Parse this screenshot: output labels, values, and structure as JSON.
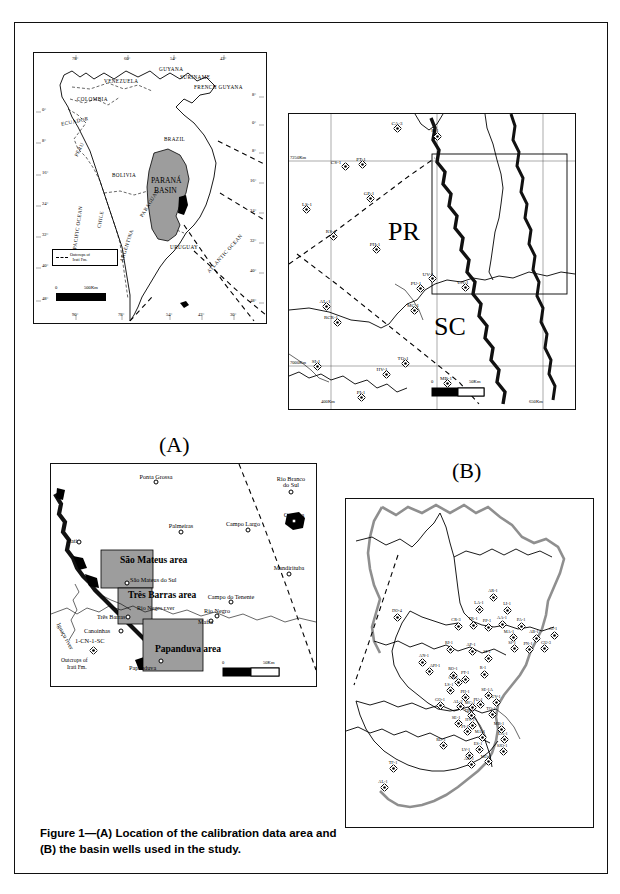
{
  "figure": {
    "caption": "Figure 1—(A) Location of the calibration data area and (B) the basin wells used in the study."
  },
  "panel_sa": {
    "name": "south-america-inset",
    "basin_label_line1": "PARANÁ",
    "basin_label_line2": "BASIN",
    "countries": [
      {
        "label": "VENEZUELA",
        "x": 88,
        "y": 30,
        "rot": 0
      },
      {
        "label": "GUYANA",
        "x": 141,
        "y": 19,
        "rot": 0
      },
      {
        "label": "SURINAME",
        "x": 160,
        "y": 27,
        "rot": 0
      },
      {
        "label": "FRENCH GUYANA",
        "x": 175,
        "y": 35,
        "rot": 0
      },
      {
        "label": "COLOMBIA",
        "x": 62,
        "y": 48,
        "rot": 0
      },
      {
        "label": "ECUADOR",
        "x": 44,
        "y": 70,
        "rot": -12
      },
      {
        "label": "PERU",
        "x": 52,
        "y": 98,
        "rot": -64
      },
      {
        "label": "BRAZIL",
        "x": 148,
        "y": 88,
        "rot": 0
      },
      {
        "label": "BOLIVIA",
        "x": 94,
        "y": 125,
        "rot": 0
      },
      {
        "label": "CHILE",
        "x": 72,
        "y": 168,
        "rot": -80
      },
      {
        "label": "PARAGUAY",
        "x": 122,
        "y": 152,
        "rot": -58
      },
      {
        "label": "ARGENTINA",
        "x": 95,
        "y": 195,
        "rot": -72
      },
      {
        "label": "URUGUAY",
        "x": 153,
        "y": 196,
        "rot": 0
      },
      {
        "label": "PACIFIC OCEAN",
        "x": 41,
        "y": 178,
        "rot": -82
      },
      {
        "label": "ATLANTIC OCEAN",
        "x": 185,
        "y": 202,
        "rot": -48
      }
    ],
    "lat_ticks": [
      "0°",
      "8°",
      "16°",
      "24°",
      "32°",
      "40°",
      "48°"
    ],
    "lat_ticks_right": [
      "8°",
      "0°",
      "8°",
      "16°",
      "24°",
      "32°",
      "40°",
      "48°"
    ],
    "lon_ticks_top": [
      "78°",
      "60°",
      "54°",
      "42°"
    ],
    "lon_ticks_bottom": [
      "90°",
      "78°",
      "54°",
      "42°",
      "30°"
    ],
    "legend_line1": "Outcrops of",
    "legend_line2": "Irati Fm.",
    "scale_zero": "0",
    "scale_max": "500Km"
  },
  "panel_pr_sc": {
    "name": "parana-santa-catarina-map",
    "state_pr": "PR",
    "state_sc": "SC",
    "axis_left_top": "7250Km",
    "axis_left_bottom": "7000Km",
    "axis_bottom_left": "400Km",
    "axis_bottom_right": "650Km",
    "scale_zero": "0",
    "scale_max": "50Km",
    "wells": [
      {
        "id": "CA-3",
        "x": 108,
        "y": 14,
        "lx": 108,
        "ly": 7
      },
      {
        "id": "R-1",
        "x": 148,
        "y": 22,
        "lx": 146,
        "ly": 14
      },
      {
        "id": "CS-1",
        "x": 56,
        "y": 52,
        "lx": 47,
        "ly": 46
      },
      {
        "id": "PT-1",
        "x": 73,
        "y": 50,
        "lx": 72,
        "ly": 43
      },
      {
        "id": "GP-1",
        "x": 81,
        "y": 84,
        "lx": 80,
        "ly": 77
      },
      {
        "id": "LS-1",
        "x": 17,
        "y": 95,
        "lx": 18,
        "ly": 88
      },
      {
        "id": "RS-1",
        "x": 44,
        "y": 122,
        "lx": 42,
        "ly": 115
      },
      {
        "id": "PH-1",
        "x": 87,
        "y": 135,
        "lx": 86,
        "ly": 128
      },
      {
        "id": "UV-1",
        "x": 143,
        "y": 164,
        "lx": 139,
        "ly": 158
      },
      {
        "id": "PU-1",
        "x": 131,
        "y": 174,
        "lx": 127,
        "ly": 167
      },
      {
        "id": "CN-1",
        "x": 176,
        "y": 173,
        "lx": 174,
        "ly": 166
      },
      {
        "id": "AL-1",
        "x": 37,
        "y": 192,
        "lx": 36,
        "ly": 185
      },
      {
        "id": "MC-1",
        "x": 125,
        "y": 196,
        "lx": 124,
        "ly": 189
      },
      {
        "id": "RCR-1",
        "x": 48,
        "y": 208,
        "lx": 42,
        "ly": 201
      },
      {
        "id": "SI-1",
        "x": 28,
        "y": 252,
        "lx": 27,
        "ly": 245
      },
      {
        "id": "TQ-1",
        "x": 116,
        "y": 249,
        "lx": 114,
        "ly": 242
      },
      {
        "id": "HV-1",
        "x": 97,
        "y": 260,
        "lx": 93,
        "ly": 253
      },
      {
        "id": "MB-1",
        "x": 158,
        "y": 269,
        "lx": 157,
        "ly": 262
      },
      {
        "id": "PI-1",
        "x": 72,
        "y": 283,
        "lx": 72,
        "ly": 276
      }
    ]
  },
  "panel_a": {
    "name": "calibration-area-map",
    "label": "(A)",
    "areas": [
      {
        "label": "São Mateus area",
        "x": 86,
        "y": 102
      },
      {
        "label": "Três Barras area",
        "x": 96,
        "y": 137
      },
      {
        "label": "Papanduva area",
        "x": 125,
        "y": 191
      }
    ],
    "river_label": "Rio Negro r.ver",
    "iguacu_label": "Iguaçu river",
    "legend_line1": "Outcrops of",
    "legend_line2": "Irati Fm.",
    "well_label": "1-CN-1-SC",
    "scale_zero": "0",
    "scale_max": "50Km",
    "cities": [
      {
        "name": "Ponta Grossa",
        "x": 105,
        "y": 18,
        "lx": 105,
        "ly": 10,
        "anchor": "center"
      },
      {
        "name": "Rio Branco\ndo Sul",
        "x": 240,
        "y": 28,
        "lx": 240,
        "ly": 12,
        "anchor": "center"
      },
      {
        "name": "Palmeiras",
        "x": 130,
        "y": 68,
        "lx": 130,
        "ly": 59,
        "anchor": "center"
      },
      {
        "name": "Campo Largo",
        "x": 197,
        "y": 66,
        "lx": 192,
        "ly": 57,
        "anchor": "center"
      },
      {
        "name": "Curitiba",
        "x": 243,
        "y": 57,
        "lx": 243,
        "ly": 48,
        "anchor": "center"
      },
      {
        "name": "Irati",
        "x": 28,
        "y": 78,
        "lx": 16,
        "ly": 74,
        "anchor": "left"
      },
      {
        "name": "Mandirituba",
        "x": 238,
        "y": 110,
        "lx": 238,
        "ly": 101,
        "anchor": "center"
      },
      {
        "name": "São Mateus do Sul",
        "x": 76,
        "y": 119,
        "lx": 79,
        "ly": 113,
        "anchor": "left"
      },
      {
        "name": "Campo do Tenente",
        "x": 180,
        "y": 138,
        "lx": 180,
        "ly": 130,
        "anchor": "center"
      },
      {
        "name": "Rio Negro",
        "x": 166,
        "y": 152,
        "lx": 166,
        "ly": 144,
        "anchor": "center"
      },
      {
        "name": "Mafra",
        "x": 160,
        "y": 157,
        "lx": 147,
        "ly": 155,
        "anchor": "left"
      },
      {
        "name": "Três Barras",
        "x": 77,
        "y": 153,
        "lx": 46,
        "ly": 150,
        "anchor": "left"
      },
      {
        "name": "Canoinhas",
        "x": 70,
        "y": 167,
        "lx": 33,
        "ly": 164,
        "anchor": "left"
      },
      {
        "name": "Papanduva",
        "x": 110,
        "y": 197,
        "lx": 78,
        "ly": 201,
        "anchor": "left"
      }
    ]
  },
  "panel_b": {
    "name": "basin-wells-map",
    "label": "(B)",
    "wells": [
      {
        "id": "DO-4",
        "x": 51,
        "y": 118,
        "lx": 51,
        "ly": 110
      },
      {
        "id": "AR-1",
        "x": 147,
        "y": 98,
        "lx": 147,
        "ly": 90
      },
      {
        "id": "LA-1",
        "x": 133,
        "y": 110,
        "lx": 133,
        "ly": 102
      },
      {
        "id": "LI-1",
        "x": 161,
        "y": 111,
        "lx": 161,
        "ly": 103
      },
      {
        "id": "CR-3",
        "x": 112,
        "y": 127,
        "lx": 110,
        "ly": 119
      },
      {
        "id": "TR-1",
        "x": 127,
        "y": 126,
        "lx": 127,
        "ly": 118
      },
      {
        "id": "PP-1",
        "x": 142,
        "y": 128,
        "lx": 141,
        "ly": 120
      },
      {
        "id": "AA-1",
        "x": 156,
        "y": 125,
        "lx": 156,
        "ly": 117
      },
      {
        "id": "PA-1",
        "x": 175,
        "y": 127,
        "lx": 175,
        "ly": 119
      },
      {
        "id": "MA-1",
        "x": 167,
        "y": 138,
        "lx": 163,
        "ly": 131
      },
      {
        "id": "AB-1",
        "x": 190,
        "y": 139,
        "lx": 188,
        "ly": 131
      },
      {
        "id": "AT-1",
        "x": 208,
        "y": 136,
        "lx": 207,
        "ly": 128
      },
      {
        "id": "SJ-1",
        "x": 168,
        "y": 149,
        "lx": 166,
        "ly": 142
      },
      {
        "id": "PN-1",
        "x": 183,
        "y": 150,
        "lx": 182,
        "ly": 143
      },
      {
        "id": "GU-3",
        "x": 198,
        "y": 149,
        "lx": 200,
        "ly": 142
      },
      {
        "id": "RI-1",
        "x": 104,
        "y": 150,
        "lx": 103,
        "ly": 142
      },
      {
        "id": "AP-1",
        "x": 126,
        "y": 152,
        "lx": 125,
        "ly": 144
      },
      {
        "id": "SI-1",
        "x": 142,
        "y": 159,
        "lx": 141,
        "ly": 151
      },
      {
        "id": "AN-1",
        "x": 76,
        "y": 163,
        "lx": 78,
        "ly": 155
      },
      {
        "id": "API-1",
        "x": 83,
        "y": 172,
        "lx": 89,
        "ly": 165
      },
      {
        "id": "RO-1",
        "x": 107,
        "y": 176,
        "lx": 107,
        "ly": 168
      },
      {
        "id": "R-1",
        "x": 138,
        "y": 175,
        "lx": 137,
        "ly": 167
      },
      {
        "id": "PT-1",
        "x": 119,
        "y": 180,
        "lx": 119,
        "ly": 172
      },
      {
        "id": "CS-2",
        "x": 112,
        "y": 183,
        "lx": 107,
        "ly": 177
      },
      {
        "id": "LS-1",
        "x": 104,
        "y": 191,
        "lx": 103,
        "ly": 184
      },
      {
        "id": "PH-1",
        "x": 119,
        "y": 198,
        "lx": 119,
        "ly": 191
      },
      {
        "id": "SE-1A",
        "x": 142,
        "y": 196,
        "lx": 141,
        "ly": 189
      },
      {
        "id": "UV-1",
        "x": 150,
        "y": 203,
        "lx": 150,
        "ly": 196
      },
      {
        "id": "PU-1",
        "x": 134,
        "y": 205,
        "lx": 132,
        "ly": 199
      },
      {
        "id": "MC-1",
        "x": 126,
        "y": 208,
        "lx": 124,
        "ly": 202
      },
      {
        "id": "AL-2",
        "x": 114,
        "y": 207,
        "lx": 112,
        "ly": 201
      },
      {
        "id": "GO-1",
        "x": 94,
        "y": 206,
        "lx": 94,
        "ly": 199
      },
      {
        "id": "TB-1",
        "x": 125,
        "y": 216,
        "lx": 123,
        "ly": 210
      },
      {
        "id": "TQ-1",
        "x": 146,
        "y": 215,
        "lx": 145,
        "ly": 208
      },
      {
        "id": "HV-1",
        "x": 126,
        "y": 226,
        "lx": 124,
        "ly": 219
      },
      {
        "id": "SE-1",
        "x": 112,
        "y": 224,
        "lx": 110,
        "ly": 217
      },
      {
        "id": "PI-1",
        "x": 121,
        "y": 232,
        "lx": 119,
        "ly": 226
      },
      {
        "id": "MB-1",
        "x": 155,
        "y": 230,
        "lx": 153,
        "ly": 223
      },
      {
        "id": "MA-1",
        "x": 136,
        "y": 238,
        "lx": 134,
        "ly": 231
      },
      {
        "id": "LA-1",
        "x": 158,
        "y": 240,
        "lx": 157,
        "ly": 233
      },
      {
        "id": "RD-1",
        "x": 97,
        "y": 246,
        "lx": 95,
        "ly": 239
      },
      {
        "id": "ES-1",
        "x": 133,
        "y": 250,
        "lx": 132,
        "ly": 243
      },
      {
        "id": "SJO-1",
        "x": 157,
        "y": 252,
        "lx": 156,
        "ly": 245
      },
      {
        "id": "LV-1",
        "x": 123,
        "y": 256,
        "lx": 120,
        "ly": 249
      },
      {
        "id": "AO-1",
        "x": 125,
        "y": 265,
        "lx": 123,
        "ly": 258
      },
      {
        "id": "MO-1",
        "x": 142,
        "y": 262,
        "lx": 140,
        "ly": 256
      },
      {
        "id": "TF-1",
        "x": 47,
        "y": 269,
        "lx": 47,
        "ly": 262
      },
      {
        "id": "AL-1",
        "x": 38,
        "y": 288,
        "lx": 37,
        "ly": 281
      }
    ]
  }
}
